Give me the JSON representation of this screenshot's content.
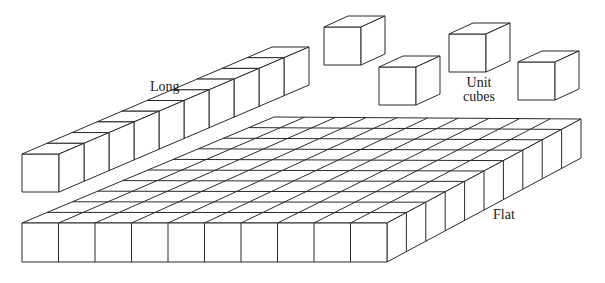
{
  "figure": {
    "line_color": "#2a2a2a",
    "fill_color": "#ffffff",
    "background": "#ffffff"
  },
  "labels": {
    "long": "Long",
    "unit_cubes": "Unit\ncubes",
    "flat": "Flat"
  },
  "blocks": {
    "long": {
      "count": 10,
      "front_x": 22,
      "front_y": 154,
      "w": 37,
      "h": 38,
      "step_dx": 25,
      "step_dy": -10.7,
      "depth_dx": 25,
      "depth_dy": -10.7
    },
    "unit_cubes": [
      {
        "x": 324,
        "y": 27,
        "w": 37,
        "h": 38,
        "dx": 24,
        "dy": -11
      },
      {
        "x": 379,
        "y": 67,
        "w": 37,
        "h": 38,
        "dx": 24,
        "dy": -11
      },
      {
        "x": 449,
        "y": 34,
        "w": 37,
        "h": 38,
        "dx": 24,
        "dy": -11
      },
      {
        "x": 518,
        "y": 62,
        "w": 37,
        "h": 38,
        "dx": 24,
        "dy": -11
      }
    ],
    "flat": {
      "cols": 10,
      "rows": 10,
      "front_x": 22,
      "front_y": 223,
      "cube_w": 36.5,
      "h": 39,
      "back_left_x": 274,
      "back_left_y": 117,
      "back_right_x": 581,
      "back_right_y": 119
    }
  }
}
